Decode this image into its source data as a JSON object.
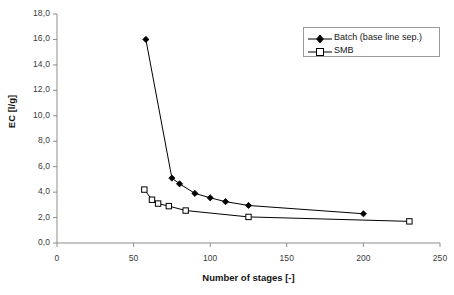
{
  "chart_data": {
    "type": "line",
    "title": "",
    "xlabel": "Number of stages [-]",
    "ylabel": "EC [l/g]",
    "xlim": [
      0,
      250
    ],
    "ylim": [
      0,
      18
    ],
    "xticks": [
      0,
      50,
      100,
      150,
      200,
      250
    ],
    "yticks": [
      0,
      2,
      4,
      6,
      8,
      10,
      12,
      14,
      16,
      18
    ],
    "xtick_labels": [
      "0",
      "50",
      "100",
      "150",
      "200",
      "250"
    ],
    "ytick_labels": [
      "0,0",
      "2,0",
      "4,0",
      "6,0",
      "8,0",
      "10,0",
      "12,0",
      "14,0",
      "16,0",
      "18,0"
    ],
    "grid": false,
    "legend_position": "top-right",
    "decimal_separator": ",",
    "series": [
      {
        "name": "Batch (base line sep.)",
        "marker": "filled-diamond",
        "color": "#000000",
        "x": [
          58,
          75,
          80,
          90,
          100,
          110,
          125,
          200
        ],
        "values": [
          16.0,
          5.1,
          4.65,
          3.9,
          3.55,
          3.25,
          2.95,
          2.3
        ]
      },
      {
        "name": "SMB",
        "marker": "open-square",
        "color": "#000000",
        "x": [
          57,
          62,
          66,
          73,
          84,
          125,
          230
        ],
        "values": [
          4.2,
          3.4,
          3.1,
          2.9,
          2.55,
          2.05,
          1.7
        ]
      }
    ]
  },
  "legend": {
    "entries": [
      {
        "label": "Batch (base line sep.)"
      },
      {
        "label": "SMB"
      }
    ]
  },
  "axes": {
    "y_title": "EC [l/g]",
    "x_title": "Number of stages [-]"
  }
}
